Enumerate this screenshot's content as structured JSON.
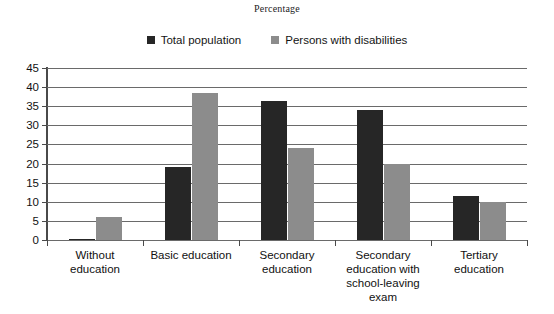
{
  "chart_data": {
    "type": "bar",
    "title": "Percentage",
    "xlabel": "",
    "ylabel": "",
    "ylim": [
      0,
      45
    ],
    "yticks": [
      0,
      5,
      10,
      15,
      20,
      25,
      30,
      35,
      40,
      45
    ],
    "grid": true,
    "legend_position": "top",
    "categories": [
      "Without education",
      "Basic education",
      "Secondary education",
      "Secondary education with school-leaving exam",
      "Tertiary education"
    ],
    "category_lines": [
      [
        "Without",
        "education"
      ],
      [
        "Basic education"
      ],
      [
        "Secondary",
        "education"
      ],
      [
        "Secondary",
        "education with",
        "school-leaving",
        "exam"
      ],
      [
        "Tertiary",
        "education"
      ]
    ],
    "series": [
      {
        "name": "Total population",
        "color": "#262626",
        "values": [
          0.3,
          19,
          36.5,
          34,
          11.5
        ]
      },
      {
        "name": "Persons with disabilities",
        "color": "#8c8c8c",
        "values": [
          6,
          38.5,
          24,
          20,
          10
        ]
      }
    ]
  },
  "colors": {
    "series_0": "#262626",
    "series_1": "#8c8c8c",
    "gridline": "#6a6a6a",
    "axis": "#4a4a4a",
    "background": "#ffffff"
  }
}
